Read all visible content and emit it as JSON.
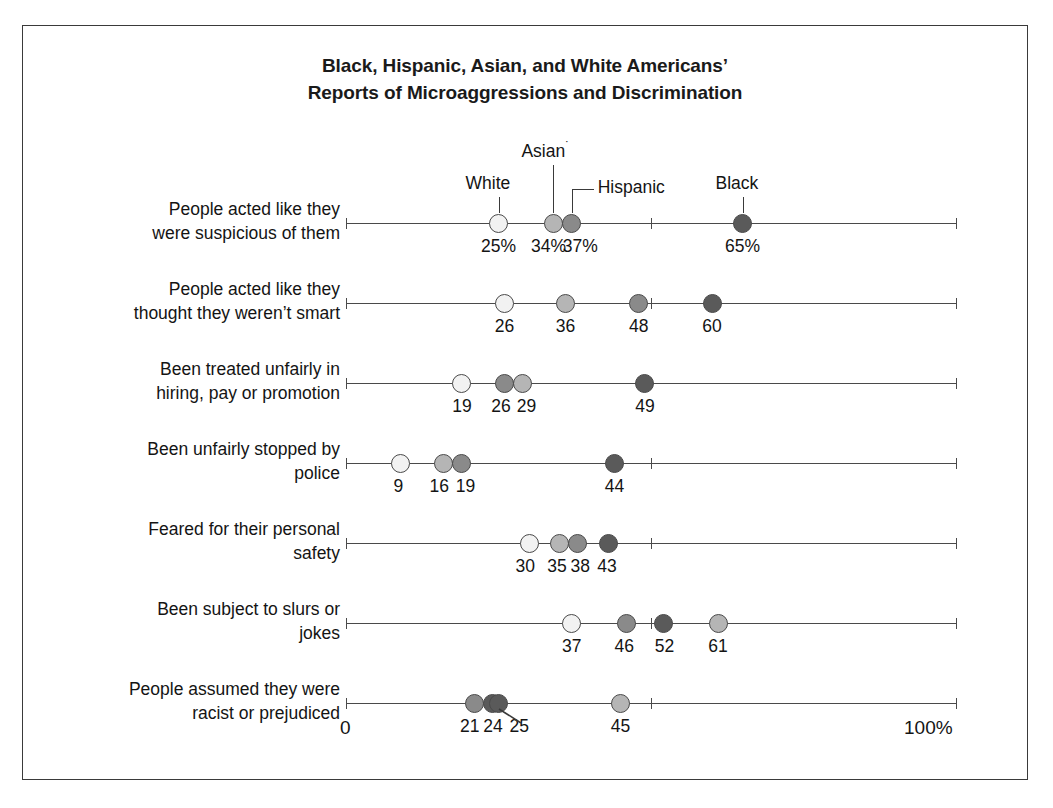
{
  "chart_data": {
    "type": "scatter",
    "title_line1": "Black, Hispanic, Asian, and White Americans’",
    "title_line2": "Reports of Microaggressions and Discrimination",
    "xlabel": "",
    "ylabel": "",
    "xlim": [
      0,
      100
    ],
    "x_tick_labels": [
      "0",
      "100%"
    ],
    "x_mid_tick": 50,
    "grid": false,
    "legend_position": "top-inline-callouts",
    "series_names": [
      "White",
      "Asian",
      "Hispanic",
      "Black"
    ],
    "series_colors": {
      "White": "#f2f2f2",
      "Asian": "#b5b5b5",
      "Hispanic": "#8a8a8a",
      "Black": "#5a5a5a"
    },
    "categories": [
      "People acted like they were suspicious of them",
      "People acted like they thought they weren’t smart",
      "Been treated unfairly in hiring, pay or promotion",
      "Been unfairly stopped by police",
      "Feared for their personal safety",
      "Been subject to slurs or jokes",
      "People assumed they were racist or prejudiced"
    ],
    "series": [
      {
        "name": "White",
        "values": [
          25,
          26,
          19,
          9,
          30,
          37,
          45
        ]
      },
      {
        "name": "Asian",
        "values": [
          34,
          36,
          29,
          16,
          35,
          61,
          45
        ]
      },
      {
        "name": "Hispanic",
        "values": [
          37,
          48,
          26,
          19,
          38,
          46,
          21
        ]
      },
      {
        "name": "Black",
        "values": [
          65,
          60,
          49,
          44,
          43,
          52,
          24
        ]
      }
    ]
  },
  "legend": {
    "white": {
      "label": "White"
    },
    "asian": {
      "label": "Asian",
      "footnote_marker": "˙"
    },
    "hispanic": {
      "label": "Hispanic"
    },
    "black": {
      "label": "Black"
    }
  },
  "axis": {
    "start_label": "0",
    "end_label": "100%"
  },
  "rows": [
    {
      "label_line1": "People acted like they",
      "label_line2": "were suspicious of them",
      "points": [
        {
          "series": "White",
          "value": 25,
          "display": "25%"
        },
        {
          "series": "Asian",
          "value": 34,
          "display": "34%"
        },
        {
          "series": "Hispanic",
          "value": 37,
          "display": "37%"
        },
        {
          "series": "Black",
          "value": 65,
          "display": "65%"
        }
      ]
    },
    {
      "label_line1": "People acted like they",
      "label_line2": "thought they weren’t smart",
      "points": [
        {
          "series": "White",
          "value": 26,
          "display": "26"
        },
        {
          "series": "Asian",
          "value": 36,
          "display": "36"
        },
        {
          "series": "Hispanic",
          "value": 48,
          "display": "48"
        },
        {
          "series": "Black",
          "value": 60,
          "display": "60"
        }
      ]
    },
    {
      "label_line1": "Been treated unfairly in",
      "label_line2": "hiring, pay or promotion",
      "points": [
        {
          "series": "White",
          "value": 19,
          "display": "19"
        },
        {
          "series": "Hispanic",
          "value": 26,
          "display": "26"
        },
        {
          "series": "Asian",
          "value": 29,
          "display": "29"
        },
        {
          "series": "Black",
          "value": 49,
          "display": "49"
        }
      ]
    },
    {
      "label_line1": "Been unfairly stopped by",
      "label_line2": "police",
      "points": [
        {
          "series": "White",
          "value": 9,
          "display": "9"
        },
        {
          "series": "Asian",
          "value": 16,
          "display": "16"
        },
        {
          "series": "Hispanic",
          "value": 19,
          "display": "19"
        },
        {
          "series": "Black",
          "value": 44,
          "display": "44"
        }
      ]
    },
    {
      "label_line1": "Feared for their personal",
      "label_line2": "safety",
      "points": [
        {
          "series": "White",
          "value": 30,
          "display": "30"
        },
        {
          "series": "Asian",
          "value": 35,
          "display": "35"
        },
        {
          "series": "Hispanic",
          "value": 38,
          "display": "38"
        },
        {
          "series": "Black",
          "value": 43,
          "display": "43"
        }
      ]
    },
    {
      "label_line1": "Been subject to slurs or",
      "label_line2": "jokes",
      "points": [
        {
          "series": "White",
          "value": 37,
          "display": "37"
        },
        {
          "series": "Hispanic",
          "value": 46,
          "display": "46"
        },
        {
          "series": "Black",
          "value": 52,
          "display": "52"
        },
        {
          "series": "Asian",
          "value": 61,
          "display": "61"
        }
      ]
    },
    {
      "label_line1": "People assumed they were",
      "label_line2": "racist or prejudiced",
      "points": [
        {
          "series": "Hispanic",
          "value": 21,
          "display": "21"
        },
        {
          "series": "Black",
          "value": 24,
          "display": "24"
        },
        {
          "series": "Black",
          "value": 25,
          "display": "25"
        },
        {
          "series": "Asian",
          "value": 45,
          "display": "45"
        }
      ]
    }
  ]
}
